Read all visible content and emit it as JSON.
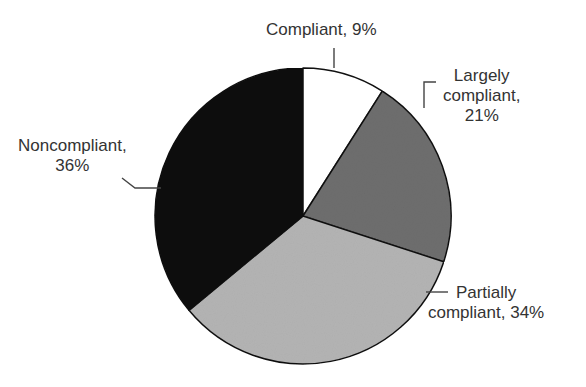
{
  "chart_data": {
    "type": "pie",
    "title": "",
    "start_angle": "12 o'clock",
    "direction": "clockwise",
    "categories": [
      "Compliant",
      "Largely compliant",
      "Partially compliant",
      "Noncompliant"
    ],
    "values": [
      9,
      21,
      34,
      36
    ],
    "unit": "%",
    "colors": [
      "#ffffff",
      "#6e6e6e",
      "#b4b4b4",
      "#0a0a0a"
    ],
    "legend": "none (leader-line labels)",
    "labels": [
      {
        "lines": [
          "Compliant, 9%"
        ],
        "position": "top"
      },
      {
        "lines": [
          "Largely",
          "compliant,",
          "21%"
        ],
        "position": "right-upper"
      },
      {
        "lines": [
          "Partially",
          "compliant, 34%"
        ],
        "position": "right-lower"
      },
      {
        "lines": [
          "Noncompliant,",
          "36%"
        ],
        "position": "left"
      }
    ]
  },
  "labels": {
    "compliant": {
      "line1": "Compliant, 9%"
    },
    "largely": {
      "line1": "Largely",
      "line2": "compliant,",
      "line3": "21%"
    },
    "partially": {
      "line1": "Partially",
      "line2": "compliant, 34%"
    },
    "noncompliant": {
      "line1": "Noncompliant,",
      "line2": "36%"
    }
  }
}
